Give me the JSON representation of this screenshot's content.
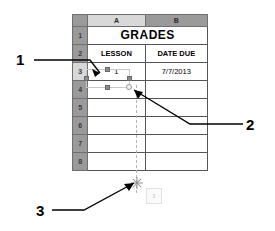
{
  "app": {
    "type": "spreadsheet-illustration",
    "title": "GRADES"
  },
  "spreadsheet": {
    "column_headers": [
      "A",
      "B"
    ],
    "selected_column": "A",
    "row_headers": [
      "1",
      "2",
      "3",
      "4",
      "5",
      "6",
      "7",
      "8"
    ],
    "selected_row": "3",
    "rows": [
      {
        "row": "1",
        "cells": [
          "GRADES",
          ""
        ],
        "merged": true
      },
      {
        "row": "2",
        "cells": [
          "LESSON",
          "DATE DUE"
        ]
      },
      {
        "row": "3",
        "cells": [
          "1",
          "7/7/2013"
        ]
      },
      {
        "row": "4",
        "cells": [
          "",
          ""
        ]
      },
      {
        "row": "5",
        "cells": [
          "",
          ""
        ]
      },
      {
        "row": "6",
        "cells": [
          "",
          ""
        ]
      },
      {
        "row": "7",
        "cells": [
          "",
          ""
        ]
      },
      {
        "row": "8",
        "cells": [
          "",
          ""
        ]
      }
    ]
  },
  "selection": {
    "cell": "A3",
    "value": "1",
    "handles": [
      "top-center-handle",
      "bottom-center-handle",
      "middle-left-handle",
      "middle-right-handle",
      "corner-circle-handle"
    ],
    "handle_color": "#8c8c8c",
    "border_color": "#c9c9c9"
  },
  "drag": {
    "guide_line_color": "#b4b4b4",
    "insert_marker": "asterisk-marker",
    "ghost_label": "1"
  },
  "callouts": [
    {
      "id": "1",
      "label": "1",
      "target": "selection-handle-left"
    },
    {
      "id": "2",
      "label": "2",
      "target": "selection-corner-circle"
    },
    {
      "id": "3",
      "label": "3",
      "target": "insert-marker"
    }
  ],
  "colors": {
    "header_gray": "#9a9a9a",
    "header_selected": "#d8d8d8",
    "grid_line": "#555555",
    "cell_background": "#ffffff",
    "text": "#000000"
  }
}
